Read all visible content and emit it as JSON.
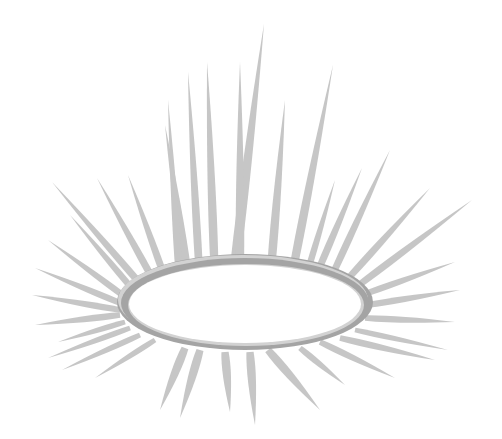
{
  "image": {
    "subject": "halo-with-radiating-rays",
    "colors": {
      "background": "#ffffff",
      "ray": "#c6c6c6",
      "ring_dark": "#a4a4a4",
      "ring_light": "#d2d2d2",
      "ring_inner": "#ffffff"
    },
    "ring": {
      "cx": 245,
      "cy": 302,
      "rx_outer": 128,
      "ry_outer": 48,
      "rx_inner": 116,
      "ry_inner": 39
    },
    "rays": [
      {
        "x1": 232,
        "y1": 290,
        "x2": 264,
        "y2": 24,
        "w": 14
      },
      {
        "x1": 215,
        "y1": 282,
        "x2": 207,
        "y2": 62,
        "w": 12
      },
      {
        "x1": 240,
        "y1": 282,
        "x2": 240,
        "y2": 62,
        "w": 12
      },
      {
        "x1": 200,
        "y1": 285,
        "x2": 188,
        "y2": 72,
        "w": 11
      },
      {
        "x1": 270,
        "y1": 282,
        "x2": 285,
        "y2": 100,
        "w": 12
      },
      {
        "x1": 190,
        "y1": 290,
        "x2": 165,
        "y2": 125,
        "w": 12
      },
      {
        "x1": 180,
        "y1": 292,
        "x2": 168,
        "y2": 100,
        "w": 10
      },
      {
        "x1": 290,
        "y1": 285,
        "x2": 333,
        "y2": 65,
        "w": 12
      },
      {
        "x1": 170,
        "y1": 292,
        "x2": 128,
        "y2": 175,
        "w": 10
      },
      {
        "x1": 160,
        "y1": 292,
        "x2": 97,
        "y2": 178,
        "w": 10
      },
      {
        "x1": 150,
        "y1": 295,
        "x2": 52,
        "y2": 182,
        "w": 10
      },
      {
        "x1": 140,
        "y1": 298,
        "x2": 70,
        "y2": 215,
        "w": 9
      },
      {
        "x1": 132,
        "y1": 302,
        "x2": 48,
        "y2": 240,
        "w": 9
      },
      {
        "x1": 125,
        "y1": 305,
        "x2": 35,
        "y2": 268,
        "w": 9
      },
      {
        "x1": 120,
        "y1": 310,
        "x2": 32,
        "y2": 295,
        "w": 9
      },
      {
        "x1": 120,
        "y1": 315,
        "x2": 35,
        "y2": 325,
        "w": 9
      },
      {
        "x1": 125,
        "y1": 322,
        "x2": 58,
        "y2": 342,
        "w": 8
      },
      {
        "x1": 130,
        "y1": 328,
        "x2": 48,
        "y2": 358,
        "w": 8
      },
      {
        "x1": 140,
        "y1": 335,
        "x2": 62,
        "y2": 370,
        "w": 8
      },
      {
        "x1": 155,
        "y1": 340,
        "x2": 95,
        "y2": 378,
        "w": 8
      },
      {
        "x1": 185,
        "y1": 348,
        "x2": 160,
        "y2": 410,
        "w": 12
      },
      {
        "x1": 200,
        "y1": 350,
        "x2": 180,
        "y2": 418,
        "w": 12
      },
      {
        "x1": 225,
        "y1": 352,
        "x2": 230,
        "y2": 412,
        "w": 12
      },
      {
        "x1": 250,
        "y1": 352,
        "x2": 255,
        "y2": 425,
        "w": 12
      },
      {
        "x1": 268,
        "y1": 350,
        "x2": 320,
        "y2": 410,
        "w": 12
      },
      {
        "x1": 300,
        "y1": 348,
        "x2": 345,
        "y2": 385,
        "w": 9
      },
      {
        "x1": 320,
        "y1": 342,
        "x2": 395,
        "y2": 378,
        "w": 9
      },
      {
        "x1": 340,
        "y1": 338,
        "x2": 435,
        "y2": 360,
        "w": 9
      },
      {
        "x1": 355,
        "y1": 330,
        "x2": 448,
        "y2": 350,
        "w": 8
      },
      {
        "x1": 365,
        "y1": 318,
        "x2": 455,
        "y2": 322,
        "w": 9
      },
      {
        "x1": 368,
        "y1": 305,
        "x2": 460,
        "y2": 290,
        "w": 9
      },
      {
        "x1": 362,
        "y1": 295,
        "x2": 455,
        "y2": 262,
        "w": 9
      },
      {
        "x1": 355,
        "y1": 288,
        "x2": 472,
        "y2": 200,
        "w": 10
      },
      {
        "x1": 345,
        "y1": 282,
        "x2": 430,
        "y2": 188,
        "w": 10
      },
      {
        "x1": 330,
        "y1": 280,
        "x2": 390,
        "y2": 150,
        "w": 10
      },
      {
        "x1": 315,
        "y1": 278,
        "x2": 362,
        "y2": 168,
        "w": 10
      },
      {
        "x1": 305,
        "y1": 280,
        "x2": 335,
        "y2": 180,
        "w": 9
      }
    ]
  }
}
